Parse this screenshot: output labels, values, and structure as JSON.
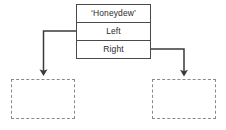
{
  "diagram": {
    "type": "binary-tree-node-pointer-diagram",
    "canvas": {
      "width": 226,
      "height": 130,
      "background": "#ffffff"
    },
    "node": {
      "label": "node-record",
      "value_row": "‘Honeydew’",
      "left_row": "Left",
      "right_row": "Right",
      "border_color": "#4a4a4a",
      "text_color": "#2b2b2b"
    },
    "children": [
      {
        "name": "left-child-placeholder",
        "label": "",
        "style": "dashed",
        "border_color": "#8a8a8a"
      },
      {
        "name": "right-child-placeholder",
        "label": "",
        "style": "dashed",
        "border_color": "#8a8a8a"
      }
    ],
    "edges": [
      {
        "name": "left-pointer-edge",
        "from": "Left",
        "to": "left-child-placeholder",
        "arrow": "down",
        "color": "#3a3a3a"
      },
      {
        "name": "right-pointer-edge",
        "from": "Right",
        "to": "right-child-placeholder",
        "arrow": "down",
        "color": "#3a3a3a"
      }
    ]
  }
}
